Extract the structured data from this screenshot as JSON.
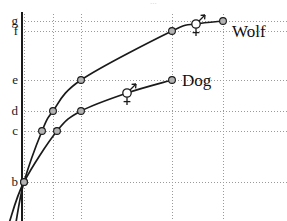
{
  "figure": {
    "title": "",
    "background_color": "#ffffff",
    "axis_color": "#1a1a1a",
    "grid_color": "#9a9a9a",
    "curve_color": "#1a1a1a",
    "marker_fill": "#b3b3b3",
    "marker_stroke": "#1a1a1a",
    "sex_marker_fill": "#ffffff",
    "clipped_header_text": "..."
  },
  "chart_data": {
    "type": "line",
    "title": "",
    "xlabel": "",
    "ylabel": "",
    "grid": true,
    "legend_position": "inline-right",
    "y_tick_labels": [
      "g",
      "f",
      "e",
      "d",
      "c",
      "b"
    ],
    "y_tick_pixels": [
      21,
      31,
      80,
      111,
      131,
      182
    ],
    "x_gridline_pixels": [
      24,
      53,
      81,
      172,
      223
    ],
    "axis_x_pixel": 22,
    "series": [
      {
        "name": "Wolf",
        "label": "Wolf",
        "label_x": 232,
        "label_y": 32,
        "points": [
          {
            "x": 24,
            "y": 182,
            "marker": "filled-circle",
            "y_level": "b"
          },
          {
            "x": 42,
            "y": 131,
            "marker": "filled-circle",
            "y_level": "c"
          },
          {
            "x": 53,
            "y": 111,
            "marker": "filled-circle",
            "y_level": "d"
          },
          {
            "x": 81,
            "y": 80,
            "marker": "filled-circle",
            "y_level": "e"
          },
          {
            "x": 172,
            "y": 31,
            "marker": "filled-circle",
            "y_level": "f"
          },
          {
            "x": 196,
            "y": 24,
            "marker": "sex-both",
            "y_level": ""
          },
          {
            "x": 223,
            "y": 21,
            "marker": "filled-circle",
            "y_level": "g"
          }
        ]
      },
      {
        "name": "Dog",
        "label": "Dog",
        "label_x": 182,
        "label_y": 81,
        "points": [
          {
            "x": 24,
            "y": 182,
            "marker": "filled-circle",
            "y_level": "b"
          },
          {
            "x": 57,
            "y": 131,
            "marker": "filled-circle",
            "y_level": "c"
          },
          {
            "x": 81,
            "y": 111,
            "marker": "filled-circle",
            "y_level": "d"
          },
          {
            "x": 127,
            "y": 93,
            "marker": "sex-both",
            "y_level": ""
          },
          {
            "x": 172,
            "y": 80,
            "marker": "filled-circle",
            "y_level": "e"
          }
        ]
      }
    ],
    "sex_symbol_legend": {
      "male_glyph": "male-arrow",
      "female_glyph": "female-cross",
      "meaning": "combined male and female symbol marker"
    }
  }
}
